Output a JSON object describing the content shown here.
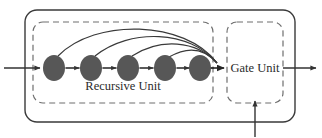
{
  "diagram": {
    "type": "block-diagram",
    "title_visible": false,
    "outer_block": {
      "name": "outer-container",
      "style": "solid-rounded-rectangle",
      "x": 25,
      "y": 10,
      "width": 270,
      "height": 112,
      "radius": 12,
      "stroke": "#3a3a3a"
    },
    "recursive_unit": {
      "label": "Recursive Unit",
      "style": "dashed-rounded-rectangle",
      "x": 33,
      "y": 22,
      "width": 180,
      "height": 81,
      "radius": 10,
      "stroke": "#6e6e6e",
      "label_x": 123,
      "label_y": 90,
      "nodes": [
        {
          "id": "node-1",
          "cx": 54,
          "cy": 68,
          "rx": 11,
          "ry": 13
        },
        {
          "id": "node-2",
          "cx": 91,
          "cy": 68,
          "rx": 11,
          "ry": 13
        },
        {
          "id": "node-3",
          "cx": 128,
          "cy": 68,
          "rx": 11,
          "ry": 13
        },
        {
          "id": "node-4",
          "cx": 165,
          "cy": 68,
          "rx": 11,
          "ry": 13
        },
        {
          "id": "node-5",
          "cx": 200,
          "cy": 68,
          "rx": 11,
          "ry": 13
        }
      ],
      "node_fill": "#575757",
      "node_count": 5
    },
    "gate_unit": {
      "label": "Gate Unit",
      "style": "dashed-rounded-rectangle",
      "x": 227,
      "y": 22,
      "width": 56,
      "height": 81,
      "radius": 10,
      "stroke": "#6e6e6e",
      "label_x": 255,
      "label_y": 70
    },
    "arrows": {
      "input": {
        "name": "input-arrow",
        "from_x": 4,
        "to_x": 41,
        "y": 68,
        "direction": "right"
      },
      "output": {
        "name": "output-arrow",
        "from_x": 283,
        "to_x": 316,
        "y": 68,
        "direction": "right"
      },
      "gate_control": {
        "name": "gate-control-arrow",
        "x": 255,
        "from_y": 136,
        "to_y": 104,
        "direction": "up"
      },
      "chain_count": 4,
      "skip_connections": [
        {
          "from_node": "node-1",
          "to": "gate-unit",
          "peak_y": 30
        },
        {
          "from_node": "node-2",
          "to": "gate-unit",
          "peak_y": 38
        },
        {
          "from_node": "node-3",
          "to": "gate-unit",
          "peak_y": 46
        },
        {
          "from_node": "node-4",
          "to": "gate-unit",
          "peak_y": 54
        }
      ],
      "converge_x": 220,
      "converge_y": 68
    },
    "colors": {
      "stroke_dark": "#3a3a3a",
      "stroke_dashed": "#6e6e6e",
      "node_fill": "#575757",
      "arrow": "#333333",
      "background": "#ffffff",
      "text": "#2b2b2b"
    }
  }
}
